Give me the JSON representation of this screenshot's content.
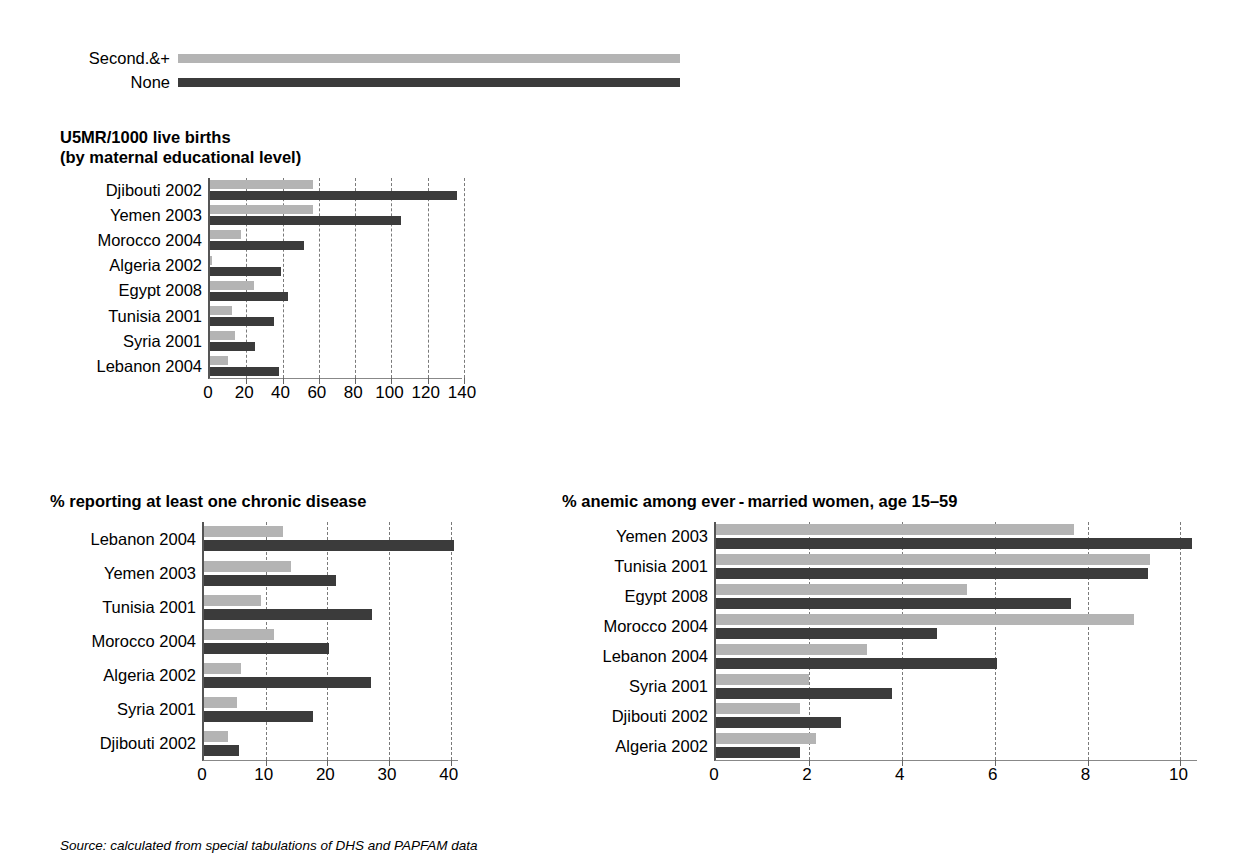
{
  "legend": {
    "items": [
      {
        "label": "Second.&+",
        "key": "secondary_plus",
        "color": "#b4b4b4"
      },
      {
        "label": "None",
        "key": "none",
        "color": "#3b3b3b"
      }
    ]
  },
  "source": {
    "text": "Source: calculated from special tabulations of DHS and PAPFAM data"
  },
  "colors": {
    "light": "#b4b4b4",
    "dark": "#3b3b3b",
    "grid": "#7a7a7a",
    "axis": "#555555"
  },
  "chart_data": [
    {
      "id": "u5mr",
      "type": "bar",
      "orientation": "horizontal",
      "title": "U5MR/1000 live births\n(by maternal educational level)",
      "xlabel": "",
      "ylabel": "",
      "xlim": [
        0,
        140
      ],
      "ticks": [
        0,
        20,
        40,
        60,
        80,
        100,
        120,
        140
      ],
      "tick_labels": [
        "0",
        "20",
        "40",
        "60",
        "80",
        "100",
        "120",
        "140"
      ],
      "grid": true,
      "legend_position": "top",
      "categories": [
        "Djibouti 2002",
        "Yemen 2003",
        "Morocco 2004",
        "Algeria 2002",
        "Egypt 2008",
        "Tunisia 2001",
        "Syria 2001",
        "Lebanon 2004"
      ],
      "series": [
        {
          "name": "Second.&+",
          "color": "#b4b4b4",
          "values": [
            57,
            57,
            17,
            1,
            24,
            12,
            14,
            10
          ]
        },
        {
          "name": "None",
          "color": "#3b3b3b",
          "values": [
            136,
            105,
            52,
            39,
            43,
            35,
            25,
            38
          ]
        }
      ]
    },
    {
      "id": "chronic-disease",
      "type": "bar",
      "orientation": "horizontal",
      "title": "% reporting at least one chronic disease",
      "xlabel": "",
      "ylabel": "",
      "xlim": [
        0,
        41.5
      ],
      "ticks": [
        0,
        10,
        20,
        30,
        40
      ],
      "tick_labels": [
        "0",
        "10",
        "20",
        "30",
        "40"
      ],
      "grid": true,
      "legend_position": "shared-top",
      "categories": [
        "Lebanon 2004",
        "Yemen 2003",
        "Tunisia 2001",
        "Morocco 2004",
        "Algeria 2002",
        "Syria 2001",
        "Djibouti 2002"
      ],
      "series": [
        {
          "name": "Second.&+",
          "color": "#b4b4b4",
          "values": [
            12.8,
            14.1,
            9.3,
            11.3,
            6.0,
            5.3,
            3.9
          ]
        },
        {
          "name": "None",
          "color": "#3b3b3b",
          "values": [
            40.6,
            21.4,
            27.2,
            20.2,
            27.1,
            17.7,
            5.6
          ]
        }
      ]
    },
    {
      "id": "anemia",
      "type": "bar",
      "orientation": "horizontal",
      "title": "% anemic among ever - married women, age 15–59",
      "xlabel": "",
      "ylabel": "",
      "xlim": [
        0,
        10.4
      ],
      "ticks": [
        0,
        2,
        4,
        6,
        8,
        10
      ],
      "tick_labels": [
        "0",
        "2",
        "4",
        "6",
        "8",
        "10"
      ],
      "grid": true,
      "legend_position": "shared-top",
      "categories": [
        "Yemen 2003",
        "Tunisia 2001",
        "Egypt 2008",
        "Morocco 2004",
        "Lebanon 2004",
        "Syria 2001",
        "Djibouti 2002",
        "Algeria 2002"
      ],
      "series": [
        {
          "name": "Second.&+",
          "color": "#b4b4b4",
          "values": [
            7.7,
            9.35,
            5.4,
            9.0,
            3.25,
            2.0,
            1.8,
            2.15
          ]
        },
        {
          "name": "None",
          "color": "#3b3b3b",
          "values": [
            10.25,
            9.3,
            7.65,
            4.75,
            6.05,
            3.8,
            2.7,
            1.8
          ]
        }
      ]
    }
  ]
}
